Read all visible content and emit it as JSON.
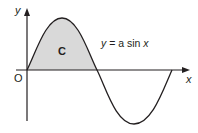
{
  "diagram": {
    "type": "function-graph",
    "function": "y = a sin x",
    "labels": {
      "y_axis": "y",
      "x_axis": "x",
      "origin": "O",
      "region": "C",
      "curve_eq_y": "y",
      "curve_eq_rest": " = a sin ",
      "curve_eq_x": "x"
    },
    "shaded_region": {
      "label": "C",
      "from": "0",
      "to": "π",
      "fill": "#d9d9d9"
    },
    "colors": {
      "curve": "#231f20",
      "axes": "#231f20",
      "shade": "#d9d9d9"
    }
  }
}
